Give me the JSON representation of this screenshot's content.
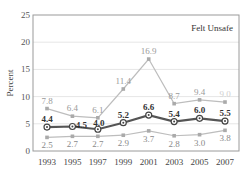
{
  "chart_data": {
    "type": "line",
    "title": "Felt Unsafe",
    "xlabel": "",
    "ylabel": "Percent",
    "ylim": [
      0,
      25
    ],
    "yticks": [
      0,
      5,
      10,
      15,
      20,
      25
    ],
    "categories": [
      "1993",
      "1995",
      "1997",
      "1999",
      "2001",
      "2003",
      "2005",
      "2007"
    ],
    "grid": true,
    "series": [
      {
        "name": "upper",
        "color": "#bdbdbd",
        "label_color": "#9a9a9a",
        "bold": false,
        "values": [
          7.8,
          6.4,
          6.1,
          11.4,
          16.9,
          8.7,
          9.4,
          9.0
        ],
        "labels": [
          "7.8",
          "6.4",
          "6.1",
          "11.4",
          "16.9",
          "8.7",
          "9.4",
          "9.0"
        ]
      },
      {
        "name": "middle",
        "color": "#555555",
        "label_color": "#333333",
        "bold": true,
        "values": [
          4.4,
          4.5,
          4.0,
          5.2,
          6.6,
          5.4,
          6.0,
          5.5
        ],
        "labels": [
          "4.4",
          "4.5",
          "4.0",
          "5.2",
          "6.6",
          "5.4",
          "6.0",
          "5.5"
        ]
      },
      {
        "name": "lower",
        "color": "#bdbdbd",
        "label_color": "#8a8a8a",
        "bold": false,
        "values": [
          2.5,
          2.7,
          2.7,
          2.9,
          3.7,
          2.8,
          3.0,
          3.8
        ],
        "labels": [
          "2.5",
          "2.7",
          "2.7",
          "2.9",
          "3.7",
          "2.8",
          "3.0",
          "3.8"
        ]
      }
    ]
  }
}
